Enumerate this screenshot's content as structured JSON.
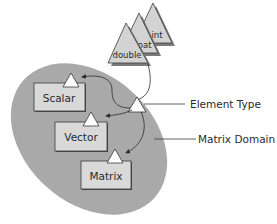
{
  "diagram": {
    "type": "concept-diagram",
    "domain_region": {
      "label": "Matrix Domain",
      "fill": "#a9a9a9"
    },
    "element_types": [
      {
        "label": "int"
      },
      {
        "label": "float"
      },
      {
        "label": "double"
      }
    ],
    "element_type_parameter": {
      "label": "Element Type"
    },
    "classes": [
      {
        "label": "Scalar"
      },
      {
        "label": "Vector"
      },
      {
        "label": "Matrix"
      }
    ],
    "colors": {
      "box_fill": "#d9d9d9",
      "triangle_fill": "#d3d3d3",
      "shadow": "#7a7a7a",
      "outline": "#3a3a3a",
      "param_triangle_fill": "#ffffff",
      "text": "#2a2a2a"
    }
  }
}
